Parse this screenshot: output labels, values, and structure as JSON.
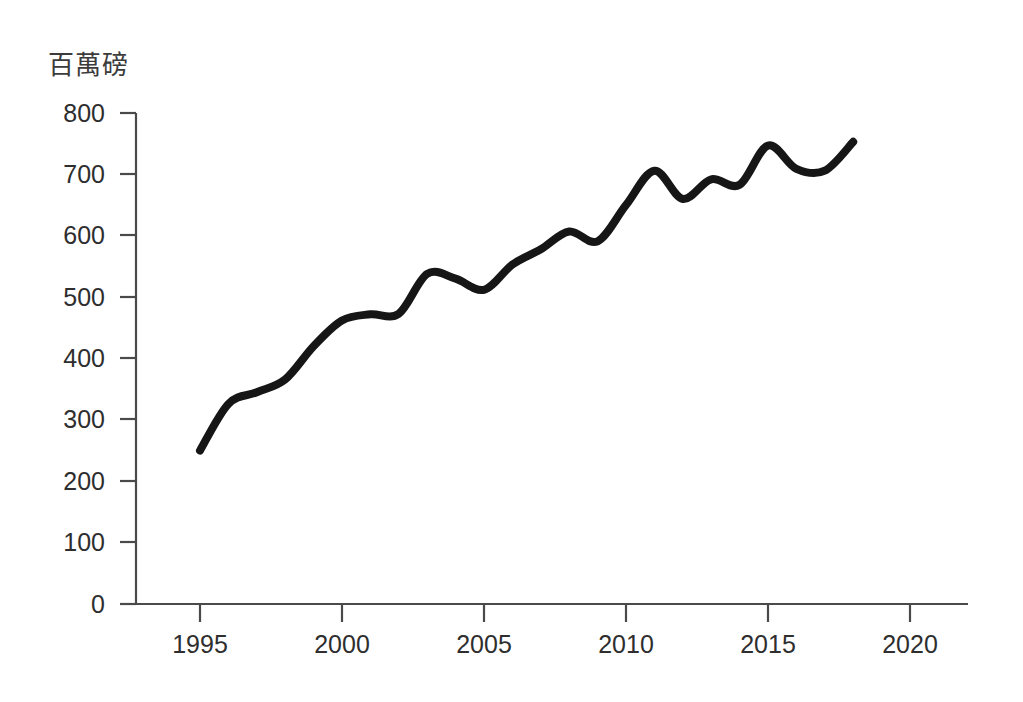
{
  "chart_data": {
    "type": "line",
    "title": "",
    "subtitle": "",
    "xlabel": "",
    "ylabel": "百萬磅",
    "ylabel_position": "above-axis-top-left",
    "xlim": [
      1993,
      2022
    ],
    "ylim": [
      0,
      800
    ],
    "grid": false,
    "legend": null,
    "legend_position": "none",
    "x_ticks": [
      1995,
      2000,
      2005,
      2010,
      2015,
      2020
    ],
    "x_tick_labels": [
      "1995",
      "2000",
      "2005",
      "2010",
      "2015",
      "2020"
    ],
    "y_ticks": [
      0,
      100,
      200,
      300,
      400,
      500,
      600,
      700,
      800
    ],
    "y_tick_labels": [
      "0",
      "100",
      "200",
      "300",
      "400",
      "500",
      "600",
      "700",
      "800"
    ],
    "series": [
      {
        "name": "百萬磅",
        "color": "#161616",
        "x": [
          1995,
          1996,
          1997,
          1998,
          1999,
          2000,
          2001,
          2002,
          2003,
          2004,
          2005,
          2006,
          2007,
          2008,
          2009,
          2010,
          2011,
          2012,
          2013,
          2014,
          2015,
          2016,
          2017,
          2018
        ],
        "values": [
          250,
          326,
          345,
          366,
          420,
          462,
          472,
          473,
          538,
          530,
          512,
          553,
          578,
          607,
          591,
          650,
          706,
          660,
          692,
          683,
          747,
          709,
          706,
          753
        ]
      }
    ]
  },
  "axes": {
    "unit_label": "百萬磅",
    "y_axis_color": "#4a4a4a",
    "x_axis_color": "#4a4a4a",
    "line_color": "#161616"
  }
}
